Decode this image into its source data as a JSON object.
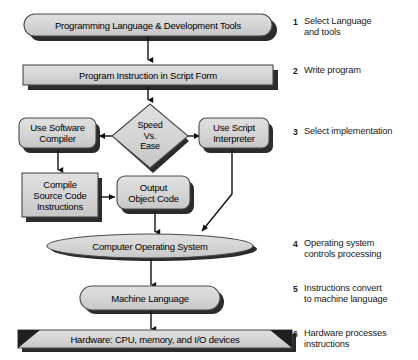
{
  "diagram": {
    "colors": {
      "shape_fill": "#d2d2d2",
      "shape_fill_light": "#dcdcdc",
      "shape_stroke": "#4a4a4a",
      "shadow": "#2b2b2b",
      "line": "#111111",
      "text": "#000000"
    },
    "nodes": [
      {
        "id": "lang_tools",
        "shape": "rounded-rect",
        "label": "Programming Language & Development Tools"
      },
      {
        "id": "script_form",
        "shape": "rect",
        "label": "Program Instruction in Script Form"
      },
      {
        "id": "decision",
        "shape": "diamond",
        "label": "Speed\nVs.\nEase"
      },
      {
        "id": "compiler",
        "shape": "rounded-rect",
        "label": "Use Software\nCompiler"
      },
      {
        "id": "interpreter",
        "shape": "rounded-rect",
        "label": "Use Script\nInterpreter"
      },
      {
        "id": "compile_src",
        "shape": "rect",
        "label": "Compile\nSource Code\nInstructions"
      },
      {
        "id": "object_code",
        "shape": "rounded-rect",
        "label": "Output\nObject Code"
      },
      {
        "id": "os",
        "shape": "ellipse",
        "label": "Computer Operating System"
      },
      {
        "id": "machine_lang",
        "shape": "rounded-rect",
        "label": "Machine Language"
      },
      {
        "id": "hardware",
        "shape": "banner",
        "label": "Hardware: CPU, memory, and I/O devices"
      }
    ],
    "steps": [
      {
        "number": "1",
        "text": "Select Language\nand tools"
      },
      {
        "number": "2",
        "text": "Write program"
      },
      {
        "number": "3",
        "text": "Select implementation"
      },
      {
        "number": "4",
        "text": "Operating system\ncontrols processing"
      },
      {
        "number": "5",
        "text": "Instructions convert\nto machine language"
      },
      {
        "number": "6",
        "text": "Hardware processes\ninstructions"
      }
    ]
  }
}
